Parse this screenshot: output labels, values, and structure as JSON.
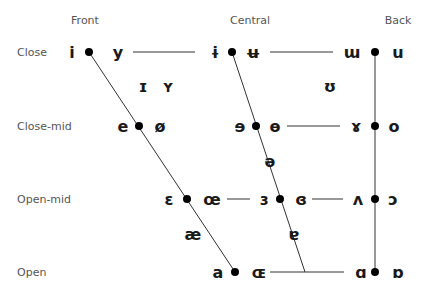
{
  "columns": [
    {
      "label": "Front",
      "x": 85,
      "y": 24
    },
    {
      "label": "Central",
      "x": 250,
      "y": 24
    },
    {
      "label": "Back",
      "x": 398,
      "y": 24
    }
  ],
  "rows": [
    {
      "label": "Close",
      "x": 17,
      "y": 56
    },
    {
      "label": "Close-mid",
      "x": 17,
      "y": 130
    },
    {
      "label": "Open-mid",
      "x": 17,
      "y": 203
    },
    {
      "label": "Open",
      "x": 17,
      "y": 276
    }
  ],
  "vowels": [
    {
      "sym": "i",
      "x": 72,
      "y": 58
    },
    {
      "sym": "y",
      "x": 118,
      "y": 58
    },
    {
      "sym": "ɨ",
      "x": 215,
      "y": 58
    },
    {
      "sym": "ʉ",
      "x": 253,
      "y": 58
    },
    {
      "sym": "ɯ",
      "x": 352,
      "y": 58
    },
    {
      "sym": "u",
      "x": 398,
      "y": 58
    },
    {
      "sym": "ɪ",
      "x": 143,
      "y": 92
    },
    {
      "sym": "ʏ",
      "x": 168,
      "y": 92
    },
    {
      "sym": "ʊ",
      "x": 330,
      "y": 92
    },
    {
      "sym": "e",
      "x": 123,
      "y": 132
    },
    {
      "sym": "ø",
      "x": 160,
      "y": 132
    },
    {
      "sym": "ɘ",
      "x": 240,
      "y": 132
    },
    {
      "sym": "ɵ",
      "x": 275,
      "y": 132
    },
    {
      "sym": "ɤ",
      "x": 356,
      "y": 132
    },
    {
      "sym": "o",
      "x": 394,
      "y": 132
    },
    {
      "sym": "ə",
      "x": 270,
      "y": 167
    },
    {
      "sym": "ɛ",
      "x": 169,
      "y": 205
    },
    {
      "sym": "œ",
      "x": 212,
      "y": 205
    },
    {
      "sym": "ɜ",
      "x": 264,
      "y": 205
    },
    {
      "sym": "ɞ",
      "x": 301,
      "y": 205
    },
    {
      "sym": "ʌ",
      "x": 358,
      "y": 205
    },
    {
      "sym": "ɔ",
      "x": 393,
      "y": 205
    },
    {
      "sym": "æ",
      "x": 193,
      "y": 240
    },
    {
      "sym": "ɐ",
      "x": 294,
      "y": 240
    },
    {
      "sym": "a",
      "x": 218,
      "y": 278
    },
    {
      "sym": "ɶ",
      "x": 259,
      "y": 278
    },
    {
      "sym": "ɑ",
      "x": 361,
      "y": 278
    },
    {
      "sym": "ɒ",
      "x": 398,
      "y": 278
    }
  ],
  "dots": [
    {
      "x": 89,
      "y": 52
    },
    {
      "x": 232,
      "y": 52
    },
    {
      "x": 375,
      "y": 52
    },
    {
      "x": 139,
      "y": 126
    },
    {
      "x": 256,
      "y": 126
    },
    {
      "x": 375,
      "y": 126
    },
    {
      "x": 187,
      "y": 199
    },
    {
      "x": 280,
      "y": 199
    },
    {
      "x": 375,
      "y": 199
    },
    {
      "x": 235,
      "y": 272
    },
    {
      "x": 375,
      "y": 272
    }
  ],
  "lines": [
    {
      "x1": 89,
      "y1": 52,
      "x2": 235,
      "y2": 272,
      "kind": "front-edge"
    },
    {
      "x1": 232,
      "y1": 52,
      "x2": 305,
      "y2": 272,
      "kind": "central-edge"
    },
    {
      "x1": 375,
      "y1": 52,
      "x2": 375,
      "y2": 272,
      "kind": "back-edge"
    },
    {
      "x1": 133,
      "y1": 52,
      "x2": 195,
      "y2": 52,
      "kind": "close-front-central"
    },
    {
      "x1": 270,
      "y1": 52,
      "x2": 333,
      "y2": 52,
      "kind": "close-central-back"
    },
    {
      "x1": 287,
      "y1": 126,
      "x2": 340,
      "y2": 126,
      "kind": "closemid-central-back"
    },
    {
      "x1": 227,
      "y1": 199,
      "x2": 250,
      "y2": 199,
      "kind": "openmid-front-central"
    },
    {
      "x1": 312,
      "y1": 199,
      "x2": 343,
      "y2": 199,
      "kind": "openmid-central-back"
    },
    {
      "x1": 270,
      "y1": 272,
      "x2": 344,
      "y2": 272,
      "kind": "open-front-back"
    }
  ]
}
